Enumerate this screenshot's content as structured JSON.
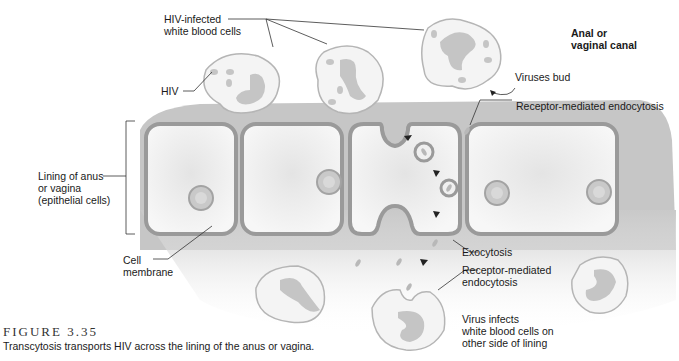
{
  "figure": {
    "title": "FIGURE 3.35",
    "caption": "Transcytosis transports HIV across the lining of the anus or vagina."
  },
  "labels": {
    "hiv_infected": "HIV-infected\nwhite blood cells",
    "hiv": "HIV",
    "canal": "Anal or\nvaginal canal",
    "viruses_bud": "Viruses bud",
    "rme_top": "Receptor-mediated endocytosis",
    "lining": "Lining of anus\nor vagina\n(epithelial cells)",
    "cell_membrane": "Cell\nmembrane",
    "exocytosis": "Exocytosis",
    "rme_bottom": "Receptor-mediated\nendocytosis",
    "virus_infects": "Virus infects\nwhite blood cells on\nother side of lining"
  },
  "colors": {
    "membrane": "#9a9a9a",
    "tissue": "#c8c8c8",
    "cell_fill": "#f2f2f2",
    "nucleus": "#b5b5b5",
    "wbc_fill": "#f4f4f4",
    "wbc_outline": "#b0b0b0",
    "text": "#1a1a1a"
  }
}
